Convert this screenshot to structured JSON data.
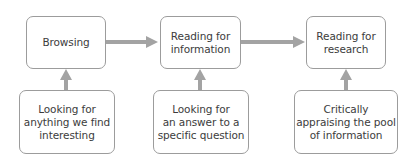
{
  "diagram": {
    "top_row": [
      {
        "id": "browsing",
        "label": "Browsing"
      },
      {
        "id": "reading-for-information",
        "label": "Reading for\ninformation"
      },
      {
        "id": "reading-for-research",
        "label": "Reading for\nresearch"
      }
    ],
    "bottom_row": [
      {
        "id": "looking-for-interesting",
        "label": "Looking for\nanything we find\ninteresting"
      },
      {
        "id": "looking-for-answer",
        "label": "Looking for\nan answer to a\nspecific question"
      },
      {
        "id": "critically-appraising",
        "label": "Critically\nappraising the pool\nof information"
      }
    ],
    "connections": [
      {
        "from": "browsing",
        "to": "reading-for-information",
        "direction": "right"
      },
      {
        "from": "reading-for-information",
        "to": "reading-for-research",
        "direction": "right"
      },
      {
        "from": "looking-for-interesting",
        "to": "browsing",
        "direction": "up"
      },
      {
        "from": "looking-for-answer",
        "to": "reading-for-information",
        "direction": "up"
      },
      {
        "from": "critically-appraising",
        "to": "reading-for-research",
        "direction": "up"
      }
    ],
    "colors": {
      "arrow": "#a3a3a3",
      "box_border": "#9c9c9c",
      "text": "#3c3c3c",
      "background": "#ffffff"
    }
  }
}
